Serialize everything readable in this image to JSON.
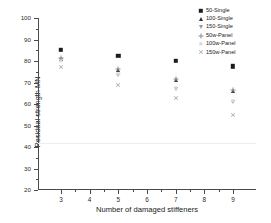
{
  "chart_data": {
    "type": "scatter",
    "title": "",
    "xlabel": "Number of damaged stiffeners",
    "ylabel": "Residual strength MN",
    "xlim": [
      2.2,
      9.8
    ],
    "ylim": [
      20,
      100
    ],
    "ytick_labels": [
      "20",
      "30",
      "40",
      "50",
      "60",
      "70",
      "80",
      "90",
      "100"
    ],
    "ytick_values": [
      20,
      30,
      40,
      50,
      60,
      70,
      80,
      90,
      100
    ],
    "xtick_labels": [
      "3",
      "4",
      "5",
      "6",
      "7",
      "8",
      "9"
    ],
    "xtick_values": [
      3,
      4,
      5,
      6,
      7,
      8,
      9
    ],
    "grid": false,
    "legend_position": "top-right",
    "x": [
      3,
      5,
      7,
      9
    ],
    "series": [
      {
        "name": "50-Single",
        "marker": "filled-square",
        "color": "#1c1c1c",
        "values": [
          85.2,
          82.5,
          80.0,
          77.5
        ]
      },
      {
        "name": "100-Single",
        "marker": "filled-triangle-up",
        "color": "#2e2e2e",
        "values": [
          81.0,
          76.0,
          71.0,
          66.0
        ]
      },
      {
        "name": "150-Single",
        "marker": "open-triangle-down",
        "color": "#9a9a9a",
        "values": [
          80.5,
          73.5,
          67.0,
          61.0
        ]
      },
      {
        "name": "50w-Panel",
        "marker": "plus",
        "color": "#8c8c8c",
        "values": [
          81.5,
          76.5,
          71.5,
          66.5
        ]
      },
      {
        "name": "100w-Panel",
        "marker": "dot-faint",
        "color": "#d8d8d8",
        "values": [
          80.0,
          74.0,
          67.5,
          61.5
        ]
      },
      {
        "name": "150w-Panel",
        "marker": "cross",
        "color": "#b4b4b4",
        "values": [
          77.0,
          69.0,
          63.0,
          55.0
        ]
      }
    ]
  }
}
